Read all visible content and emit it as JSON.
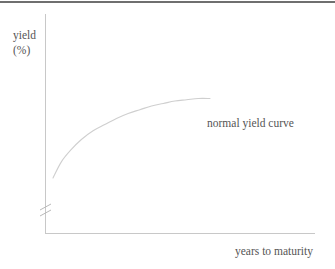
{
  "figure": {
    "y_axis_label_line1": "yield",
    "y_axis_label_line2": "(%)",
    "x_axis_label": "years to maturity",
    "curve_annotation": "normal yield curve",
    "axis_break_symbol": "axis-break-marks",
    "colors": {
      "axis_line": "#c8c8c8",
      "curve_line": "#cfcfcf",
      "text": "#555555",
      "top_border": "#6f6f6f",
      "background": "#ffffff"
    }
  },
  "chart_data": {
    "type": "line",
    "title": "",
    "xlabel": "years to maturity",
    "ylabel": "yield (%)",
    "xlim": [
      0,
      100
    ],
    "ylim": [
      0,
      100
    ],
    "grid": false,
    "legend": "none",
    "axis_break": {
      "axis": "y",
      "position_fraction": 0.12
    },
    "annotations": [
      {
        "text": "normal yield curve",
        "x": 60,
        "y": 42
      }
    ],
    "series": [
      {
        "name": "normal yield curve",
        "x": [
          3,
          8,
          14,
          20,
          27,
          34,
          41,
          48,
          55,
          62,
          69,
          76,
          83,
          90,
          97
        ],
        "y": [
          25,
          38,
          48,
          56,
          63,
          68,
          73,
          77,
          80,
          83,
          85,
          87,
          88,
          89,
          89
        ]
      }
    ]
  }
}
